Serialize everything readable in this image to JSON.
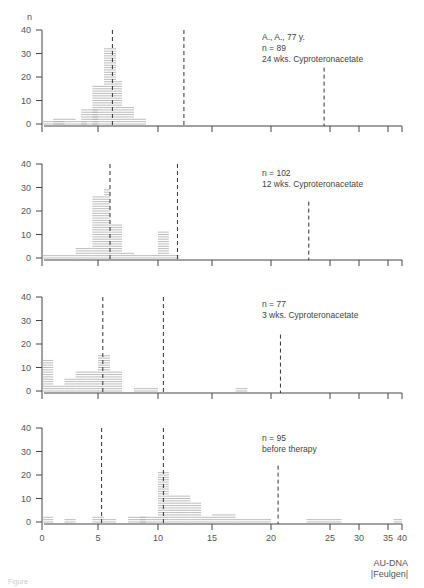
{
  "chart_data": {
    "type": "bar",
    "orientation": "histogram-stacked-panels",
    "y_axis_label": "n",
    "x_axis_label": "AU-DNA",
    "x_axis_sublabel": "|Feulgen|",
    "x_ticks": [
      0,
      5,
      10,
      15,
      20,
      25,
      30,
      35,
      40
    ],
    "y_ticks": [
      0,
      10,
      20,
      30,
      40
    ],
    "ylim": [
      0,
      40
    ],
    "grid": false,
    "panels": [
      {
        "id": "panel-24wks",
        "annotation": [
          "A., A., 77 y.",
          "n = 89",
          "24 wks. Cyproteronacetate"
        ],
        "n": 89,
        "reference_lines": [
          6.2,
          12.4,
          24.5
        ],
        "bins": [
          {
            "x0": 0,
            "x1": 2,
            "value": 1
          },
          {
            "x0": 1,
            "x1": 3,
            "value": 2
          },
          {
            "x0": 3,
            "x1": 4,
            "value": 1
          },
          {
            "x0": 3.5,
            "x1": 5,
            "value": 6
          },
          {
            "x0": 4.5,
            "x1": 5.5,
            "value": 16
          },
          {
            "x0": 5.5,
            "x1": 6.5,
            "value": 32
          },
          {
            "x0": 6.5,
            "x1": 7,
            "value": 18
          },
          {
            "x0": 7,
            "x1": 8,
            "value": 7
          },
          {
            "x0": 8,
            "x1": 9,
            "value": 2
          }
        ]
      },
      {
        "id": "panel-12wks",
        "annotation": [
          "n = 102",
          "12 wks. Cyproteronacetate"
        ],
        "n": 102,
        "reference_lines": [
          6.0,
          11.8,
          23.2
        ],
        "bins": [
          {
            "x0": 0,
            "x1": 3,
            "value": 1
          },
          {
            "x0": 3,
            "x1": 4.5,
            "value": 4
          },
          {
            "x0": 4.5,
            "x1": 5.5,
            "value": 26
          },
          {
            "x0": 5.5,
            "x1": 6,
            "value": 29
          },
          {
            "x0": 6,
            "x1": 7,
            "value": 14
          },
          {
            "x0": 7,
            "x1": 8,
            "value": 2
          },
          {
            "x0": 8,
            "x1": 10,
            "value": 1
          },
          {
            "x0": 10,
            "x1": 11,
            "value": 11
          },
          {
            "x0": 11,
            "x1": 12,
            "value": 1
          }
        ]
      },
      {
        "id": "panel-3wks",
        "annotation": [
          "n = 77",
          "3 wks. Cyproteronacetate"
        ],
        "n": 77,
        "reference_lines": [
          5.4,
          10.5,
          20.8
        ],
        "bins": [
          {
            "x0": 0,
            "x1": 1,
            "value": 14
          },
          {
            "x0": 1,
            "x1": 2,
            "value": 3
          },
          {
            "x0": 2,
            "x1": 3,
            "value": 6
          },
          {
            "x0": 3,
            "x1": 4,
            "value": 9
          },
          {
            "x0": 4,
            "x1": 5,
            "value": 9
          },
          {
            "x0": 5,
            "x1": 6,
            "value": 16
          },
          {
            "x0": 6,
            "x1": 7,
            "value": 9
          },
          {
            "x0": 8,
            "x1": 9,
            "value": 2
          },
          {
            "x0": 9,
            "x1": 10,
            "value": 1
          },
          {
            "x0": 17,
            "x1": 18,
            "value": 1
          }
        ]
      },
      {
        "id": "panel-before",
        "annotation": [
          "n = 95",
          "before therapy"
        ],
        "n": 95,
        "reference_lines": [
          5.3,
          10.5,
          20.6
        ],
        "bins": [
          {
            "x0": 0,
            "x1": 1,
            "value": 2
          },
          {
            "x0": 2,
            "x1": 3,
            "value": 1
          },
          {
            "x0": 4.5,
            "x1": 5.5,
            "value": 2
          },
          {
            "x0": 5.5,
            "x1": 6.5,
            "value": 1
          },
          {
            "x0": 7.5,
            "x1": 9,
            "value": 2
          },
          {
            "x0": 8.5,
            "x1": 10,
            "value": 3
          },
          {
            "x0": 10,
            "x1": 11,
            "value": 22
          },
          {
            "x0": 11,
            "x1": 13,
            "value": 12
          },
          {
            "x0": 13,
            "x1": 14,
            "value": 9
          },
          {
            "x0": 14,
            "x1": 15,
            "value": 2
          },
          {
            "x0": 15,
            "x1": 17,
            "value": 4
          },
          {
            "x0": 17,
            "x1": 20,
            "value": 1
          },
          {
            "x0": 23,
            "x1": 27,
            "value": 1
          },
          {
            "x0": 37,
            "x1": 40,
            "value": 1
          }
        ]
      }
    ]
  },
  "caption": "Figure"
}
